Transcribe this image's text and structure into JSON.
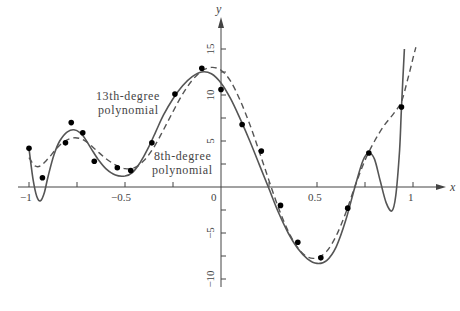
{
  "chart_data": {
    "type": "line",
    "title": "",
    "xlabel": "x",
    "ylabel": "y",
    "xlim": [
      -1,
      1.05
    ],
    "ylim": [
      -10.5,
      17.5
    ],
    "grid": false,
    "legend": "none (curves labeled inline)",
    "x_ticks": [
      -1,
      -0.75,
      -0.5,
      -0.25,
      0,
      0.25,
      0.5,
      0.75,
      1
    ],
    "x_tick_labels": [
      "-1",
      "",
      "-0.5",
      "",
      "0",
      "",
      "0.5",
      "",
      "1"
    ],
    "y_ticks": [
      -10,
      -7.5,
      -5,
      -2.5,
      0,
      2.5,
      5,
      7.5,
      10,
      12.5,
      15
    ],
    "y_tick_labels": [
      "-10",
      "",
      "-5",
      "",
      "0",
      "",
      "5",
      "",
      "10",
      "",
      "15"
    ],
    "annotations": [
      {
        "text_line1": "13th-degree",
        "text_line2": "polynomial",
        "target": "solid curve"
      },
      {
        "text_line1": "8th-degree",
        "text_line2": "polynomial",
        "target": "dashed curve"
      }
    ],
    "series": [
      {
        "name": "data points",
        "style": "scatter",
        "points": [
          [
            -1.0,
            4.2
          ],
          [
            -0.93,
            1.0
          ],
          [
            -0.81,
            4.8
          ],
          [
            -0.78,
            7.0
          ],
          [
            -0.72,
            5.9
          ],
          [
            -0.66,
            2.8
          ],
          [
            -0.54,
            2.1
          ],
          [
            -0.47,
            1.8
          ],
          [
            -0.36,
            4.8
          ],
          [
            -0.24,
            10.1
          ],
          [
            -0.1,
            12.9
          ],
          [
            0.0,
            10.6
          ],
          [
            0.11,
            6.8
          ],
          [
            0.21,
            3.9
          ],
          [
            0.31,
            -2.0
          ],
          [
            0.4,
            -6.0
          ],
          [
            0.52,
            -7.7
          ],
          [
            0.66,
            -2.3
          ],
          [
            0.77,
            3.7
          ],
          [
            0.94,
            8.7
          ]
        ]
      },
      {
        "name": "13th-degree polynomial",
        "style": "solid",
        "points": [
          [
            -1.0,
            4.2
          ],
          [
            -0.98,
            1.0
          ],
          [
            -0.96,
            -1.0
          ],
          [
            -0.94,
            -1.5
          ],
          [
            -0.92,
            -0.6
          ],
          [
            -0.9,
            1.2
          ],
          [
            -0.87,
            3.5
          ],
          [
            -0.84,
            5.0
          ],
          [
            -0.8,
            6.0
          ],
          [
            -0.76,
            6.2
          ],
          [
            -0.72,
            5.6
          ],
          [
            -0.68,
            4.3
          ],
          [
            -0.64,
            3.0
          ],
          [
            -0.6,
            2.0
          ],
          [
            -0.55,
            1.3
          ],
          [
            -0.5,
            1.2
          ],
          [
            -0.46,
            1.6
          ],
          [
            -0.42,
            2.7
          ],
          [
            -0.38,
            4.2
          ],
          [
            -0.34,
            6.0
          ],
          [
            -0.3,
            7.8
          ],
          [
            -0.25,
            9.6
          ],
          [
            -0.2,
            11.0
          ],
          [
            -0.15,
            12.0
          ],
          [
            -0.1,
            12.5
          ],
          [
            -0.05,
            12.3
          ],
          [
            0.0,
            11.3
          ],
          [
            0.05,
            9.6
          ],
          [
            0.1,
            7.4
          ],
          [
            0.15,
            5.0
          ],
          [
            0.2,
            2.4
          ],
          [
            0.25,
            -0.2
          ],
          [
            0.3,
            -2.8
          ],
          [
            0.35,
            -5.0
          ],
          [
            0.4,
            -6.7
          ],
          [
            0.45,
            -7.8
          ],
          [
            0.5,
            -8.3
          ],
          [
            0.55,
            -8.0
          ],
          [
            0.6,
            -6.5
          ],
          [
            0.65,
            -3.6
          ],
          [
            0.7,
            0.2
          ],
          [
            0.74,
            2.9
          ],
          [
            0.77,
            3.7
          ],
          [
            0.8,
            3.0
          ],
          [
            0.83,
            0.6
          ],
          [
            0.86,
            -1.7
          ],
          [
            0.89,
            -2.6
          ],
          [
            0.91,
            -1.0
          ],
          [
            0.93,
            4.0
          ],
          [
            0.94,
            8.7
          ],
          [
            0.955,
            15.0
          ]
        ]
      },
      {
        "name": "8th-degree polynomial",
        "style": "dashed",
        "points": [
          [
            -1.0,
            3.2
          ],
          [
            -0.97,
            2.3
          ],
          [
            -0.94,
            2.3
          ],
          [
            -0.9,
            3.1
          ],
          [
            -0.86,
            4.1
          ],
          [
            -0.82,
            4.9
          ],
          [
            -0.78,
            5.3
          ],
          [
            -0.74,
            5.3
          ],
          [
            -0.7,
            4.9
          ],
          [
            -0.65,
            4.0
          ],
          [
            -0.6,
            3.1
          ],
          [
            -0.55,
            2.4
          ],
          [
            -0.5,
            2.0
          ],
          [
            -0.45,
            2.1
          ],
          [
            -0.4,
            2.9
          ],
          [
            -0.35,
            4.3
          ],
          [
            -0.3,
            6.2
          ],
          [
            -0.25,
            8.2
          ],
          [
            -0.2,
            10.1
          ],
          [
            -0.15,
            11.6
          ],
          [
            -0.1,
            12.6
          ],
          [
            -0.05,
            13.0
          ],
          [
            0.0,
            12.7
          ],
          [
            0.05,
            11.5
          ],
          [
            0.1,
            9.4
          ],
          [
            0.15,
            6.8
          ],
          [
            0.2,
            3.8
          ],
          [
            0.25,
            0.7
          ],
          [
            0.3,
            -2.3
          ],
          [
            0.35,
            -4.8
          ],
          [
            0.4,
            -6.6
          ],
          [
            0.45,
            -7.6
          ],
          [
            0.5,
            -7.7
          ],
          [
            0.55,
            -7.0
          ],
          [
            0.6,
            -5.3
          ],
          [
            0.65,
            -2.8
          ],
          [
            0.7,
            0.2
          ],
          [
            0.75,
            2.9
          ],
          [
            0.8,
            5.0
          ],
          [
            0.85,
            6.7
          ],
          [
            0.9,
            8.0
          ],
          [
            0.94,
            9.3
          ],
          [
            0.97,
            11.5
          ],
          [
            1.0,
            14.0
          ],
          [
            1.015,
            15.2
          ]
        ]
      }
    ]
  },
  "labels": {
    "x_axis": "x",
    "y_axis": "y",
    "annot_13_line1": "13th-degree",
    "annot_13_line2": "polynomial",
    "annot_8_line1": "8th-degree",
    "annot_8_line2": "polynomial",
    "xtick_m1": "−1",
    "xtick_m05": "−0.5",
    "xtick_0": "0",
    "xtick_05": "0.5",
    "xtick_1": "1",
    "ytick_15": "15",
    "ytick_10": "10",
    "ytick_5": "5",
    "ytick_m5": "−5",
    "ytick_m10": "−10"
  },
  "colors": {
    "axis": "#444444",
    "curve": "#555555",
    "point": "#000000",
    "text": "#444444"
  }
}
